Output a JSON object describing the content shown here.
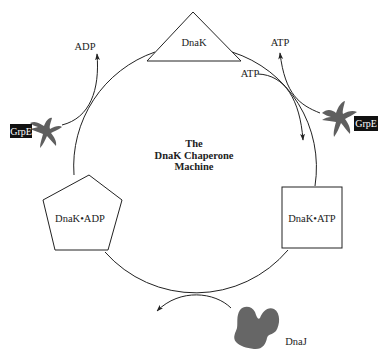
{
  "diagram": {
    "title_lines": [
      "The",
      "DnaK Chaperone",
      "Machine"
    ],
    "states": [
      {
        "shape": "triangle",
        "label": "DnaK"
      },
      {
        "shape": "square",
        "label": "DnaK•ATP"
      },
      {
        "shape": "pentagon",
        "label": "DnaK•ADP"
      }
    ],
    "cofactors": {
      "grpe_left": "GrpE",
      "grpe_right": "GrpE",
      "dnaj": "DnaJ"
    },
    "nucleotides": {
      "adp_released": "ADP",
      "atp_released": "ATP",
      "atp_bound": "ATP"
    },
    "colors": {
      "line": "#222222",
      "protein_fill": "#6b6b6b",
      "tag_bg": "#111111"
    }
  }
}
